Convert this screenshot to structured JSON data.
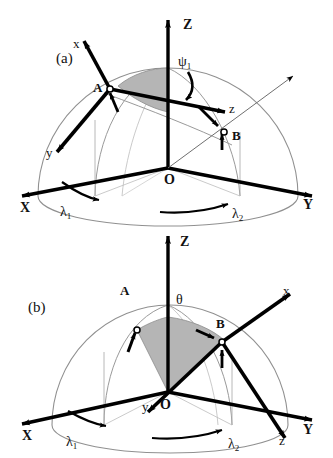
{
  "figure": {
    "type": "scientific-diagram",
    "background_color": "#ffffff",
    "line_color": "#000000",
    "arc_color": "#8a8a8a",
    "shade_color": "#b5b5b5"
  },
  "panel_a": {
    "panel_label": "(a)",
    "global_axes": {
      "z": "Z",
      "x": "X",
      "y": "Y"
    },
    "origin_label": "O",
    "points": {
      "a": "A",
      "b": "B"
    },
    "local_axes": {
      "x": "x",
      "y": "y",
      "z": "z"
    },
    "angle_label": "ψ",
    "angle_subscript": "1",
    "arcs": {
      "lambda1": "λ",
      "lambda1_sub": "1",
      "lambda2": "λ",
      "lambda2_sub": "2"
    }
  },
  "panel_b": {
    "panel_label": "(b)",
    "global_axes": {
      "z": "Z",
      "x": "X",
      "y": "Y"
    },
    "origin_label": "O",
    "points": {
      "a": "A",
      "b": "B"
    },
    "local_axes": {
      "x": "x",
      "y": "y",
      "z": "z"
    },
    "angle_label": "θ",
    "arcs": {
      "lambda1": "λ",
      "lambda1_sub": "1",
      "lambda2": "λ",
      "lambda2_sub": "2"
    }
  }
}
